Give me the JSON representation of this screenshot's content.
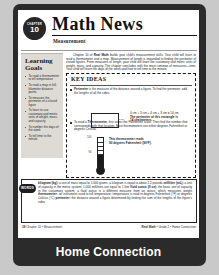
{
  "viewer": {
    "caption": "Home Connection"
  },
  "header": {
    "badge_label": "CHAPTER",
    "badge_number": "10",
    "title": "Math News",
    "subtitle": "Measurement"
  },
  "sidebar": {
    "title": "Learning Goals",
    "items": [
      "To read a thermometer to tell temperature",
      "To read a map in full-kilometer distance points",
      "To measure the perimeter of a closed figure",
      "To learn to use customary and metric units of weight, mass, and capacity",
      "To number the days of the week",
      "To tell time to the minute"
    ]
  },
  "intro": {
    "text_before_bold": "Chapter 10 of ",
    "bold_text": "Real Math",
    "text_after_bold": " builds your child's measurement skills. Your child will learn to read a thermometer and a map. Measurement of length is expanded to finding the perimeter of closed figures. From measures of length, your child will learn the customary and metric units of weight, mass, and capacity. The chapter concludes with the most common of measures—time. Your child will learn the days of the week and how to tell time to the minute."
  },
  "key_ideas": {
    "title": "KEY IDEAS",
    "items": [
      {
        "term": "Perimeter",
        "definition": " is the measure of the distance around a figure. To find the perimeter, add the lengths of all the sides.",
        "figure": {
          "type": "rectangle",
          "width_label": "4 cm",
          "height_label": "3 cm",
          "equation": "4 cm + 3 cm + 4 cm + 3 cm = 14 cm",
          "result_line1": "The perimeter of this rectangle is",
          "result_line2": "14 centimeters."
        }
      },
      {
        "term": "Thermometer",
        "definition_before": "To read a ",
        "definition": ", first select the Fahrenheit scale. Then find the number that corresponds with that location. Most thermometers use either degrees Fahrenheit or degrees Celsius.",
        "figure": {
          "type": "thermometer",
          "top_label": "100",
          "reading_label": "90",
          "caption_line1": "This thermometer reads",
          "caption_line2": "90 degrees Fahrenheit (90°F)."
        }
      }
    ]
  },
  "vocabulary": {
    "badge": "WORDS",
    "entries": [
      {
        "term": "kilogram (kg):",
        "definition": " a unit of mass equal to 1,000 grams; a kilogram is equal to about 2.2 pounds"
      },
      {
        "term": "milliliter (mL):",
        "definition": " a unit of capacity in the metric system; 1,000 milliliters are equal to 1 liter"
      },
      {
        "term": "fluid ounce (fl oz):",
        "definition": " the basic unit of capacity in the customary system; a fluid ounce is a different measure from an ounce, which measures weight"
      },
      {
        "term": "thermometer:",
        "definition": " an instrument used to tell temperature; temperature is read in degrees Fahrenheit (°F) or degrees Celsius (°C)"
      },
      {
        "term": "perimeter:",
        "definition": " the distance around a figure determined by finding the sum of the lengths of the figure's sides"
      }
    ]
  },
  "page_footer": {
    "page_number": "38",
    "left_text": "Chapter 10 • Measurement",
    "right_brand": "Real Math",
    "right_rest": " • Grade 2 • Home Connection"
  }
}
